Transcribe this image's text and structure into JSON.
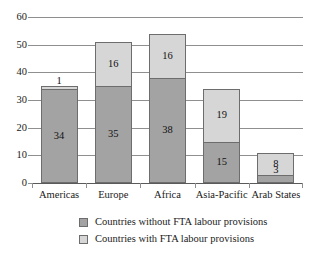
{
  "chart_data": {
    "type": "bar",
    "stacked": true,
    "title": "",
    "subtitle": "",
    "xlabel": "",
    "ylabel": "",
    "ylim": [
      0,
      60
    ],
    "yticks": [
      0,
      10,
      20,
      30,
      40,
      50,
      60
    ],
    "ytick_labels": [
      "0",
      "10",
      "20",
      "30",
      "40",
      "50",
      "60"
    ],
    "grid": true,
    "legend_position": "bottom",
    "categories": [
      "Americas",
      "Europe",
      "Africa",
      "Asia-Pacific",
      "Arab States"
    ],
    "series": [
      {
        "name": "Countries without FTA labour provisions",
        "color": "#a3a3a3",
        "values": [
          34,
          35,
          38,
          15,
          3
        ],
        "value_labels": [
          "34",
          "35",
          "38",
          "15",
          "3"
        ]
      },
      {
        "name": "Countries with FTA labour provisions",
        "color": "#d6d6d6",
        "values": [
          1,
          16,
          16,
          19,
          8
        ],
        "value_labels": [
          "1",
          "16",
          "16",
          "19",
          "8"
        ]
      }
    ],
    "totals": [
      35,
      51,
      54,
      34,
      11
    ]
  },
  "legend": {
    "items": [
      {
        "label": "Countries without FTA labour provisions",
        "swatch": "dark"
      },
      {
        "label": "Countries with FTA labour provisions",
        "swatch": "light"
      }
    ]
  },
  "colors": {
    "series_dark": "#a3a3a3",
    "series_light": "#d6d6d6",
    "gridline": "#8f8f8f",
    "bar_border": "#6d6d6d",
    "text": "#1a1a1a",
    "background": "#ffffff"
  }
}
